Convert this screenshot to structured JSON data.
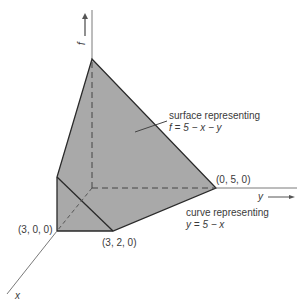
{
  "diagram": {
    "axes": {
      "f": {
        "label": "f",
        "arrow": "up-arrow-icon"
      },
      "y": {
        "label": "y",
        "arrow": "right-arrow-icon"
      },
      "x": {
        "label": "x"
      }
    },
    "points": {
      "p300": "(3, 0, 0)",
      "p320": "(3, 2, 0)",
      "p050": "(0, 5, 0)"
    },
    "annotations": {
      "surface_line1": "surface representing",
      "surface_line2": "f = 5 − x − y",
      "curve_line1": "curve representing",
      "curve_line2": "y = 5 − x"
    },
    "colors": {
      "surface_fill": "#a9a9a9",
      "edge": "#2a2a2a",
      "axis": "#7a7a7a"
    }
  }
}
